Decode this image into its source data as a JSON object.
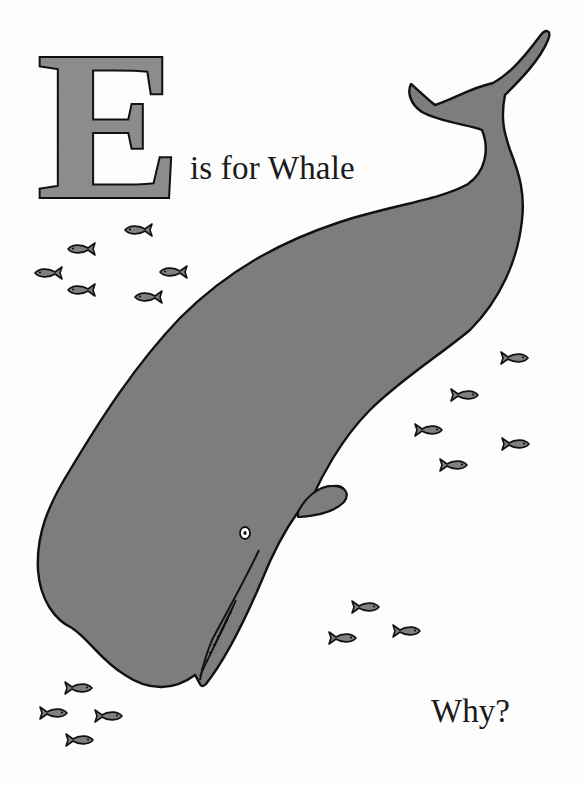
{
  "page": {
    "big_letter": "E",
    "caption": "is for Whale",
    "question": "Why?"
  },
  "illustration": {
    "subject": "sperm whale diving head-down",
    "fill_color": "#7d7d7d",
    "outline_color": "#111111",
    "letter_fill_color": "#8c8c8c",
    "background_color": "#fdfdfd",
    "fish_groups": [
      {
        "name": "upper-left-school",
        "count": 6,
        "facing": "left"
      },
      {
        "name": "right-school",
        "count": 5,
        "facing": "right"
      },
      {
        "name": "lower-middle-school",
        "count": 3,
        "facing": "right"
      },
      {
        "name": "bottom-left-school",
        "count": 4,
        "facing": "right"
      }
    ]
  }
}
